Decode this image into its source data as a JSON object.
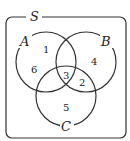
{
  "diagram": {
    "type": "venn",
    "universe_label": "S",
    "sets": [
      {
        "label": "A",
        "cx": 46,
        "cy": 62,
        "r": 30
      },
      {
        "label": "B",
        "cx": 86,
        "cy": 62,
        "r": 30
      },
      {
        "label": "C",
        "cx": 66,
        "cy": 96,
        "r": 30
      }
    ],
    "regions": [
      {
        "id": "A_only",
        "value": "1",
        "x": 45,
        "y": 50
      },
      {
        "id": "A_only_2",
        "value": "6",
        "x": 33,
        "y": 73
      },
      {
        "id": "B_only",
        "value": "4",
        "x": 94,
        "y": 65
      },
      {
        "id": "ABC",
        "value": "3",
        "x": 66,
        "y": 80
      },
      {
        "id": "BC",
        "value": "2",
        "x": 82,
        "y": 86
      },
      {
        "id": "C_only",
        "value": "5",
        "x": 66,
        "y": 111
      }
    ],
    "stroke_color": "#333333"
  }
}
